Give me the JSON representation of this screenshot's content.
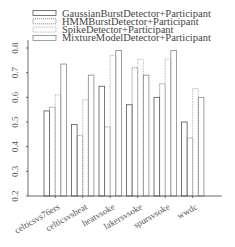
{
  "chart_data": {
    "type": "bar",
    "title": "",
    "xlabel": "",
    "ylabel": "",
    "ylim": [
      0.2,
      0.85
    ],
    "yticks": [
      0.2,
      0.3,
      0.4,
      0.5,
      0.6,
      0.7,
      0.8
    ],
    "ytick_labels": [
      "0.2",
      "0.3",
      "0.4",
      "0.5",
      "0.6",
      "0.7",
      "0.8"
    ],
    "grid": false,
    "legend_position": "top",
    "categories": [
      "celticsvs76ers",
      "celticsvsheat",
      "heatvsoke",
      "lakersvsoke",
      "spursvsoke",
      "wwdc"
    ],
    "series": [
      {
        "name": "GaussianBurstDetector+Participant",
        "values": [
          0.545,
          0.49,
          0.645,
          0.57,
          0.6,
          0.5
        ],
        "stroke": "#555555",
        "dash": ""
      },
      {
        "name": "HMMBurstDetector+Participant",
        "values": [
          0.56,
          0.445,
          0.48,
          0.72,
          0.655,
          0.435
        ],
        "stroke": "#777777",
        "dash": "1.2,0.8"
      },
      {
        "name": "SpikeDetector+Participant",
        "values": [
          0.61,
          0.59,
          0.77,
          0.755,
          0.755,
          0.635
        ],
        "stroke": "#999999",
        "dash": "0.8,0.8"
      },
      {
        "name": "MixtureModelDetector+Participant",
        "values": [
          0.735,
          0.69,
          0.79,
          0.69,
          0.79,
          0.6
        ],
        "stroke": "#888888",
        "dash": ""
      }
    ]
  }
}
